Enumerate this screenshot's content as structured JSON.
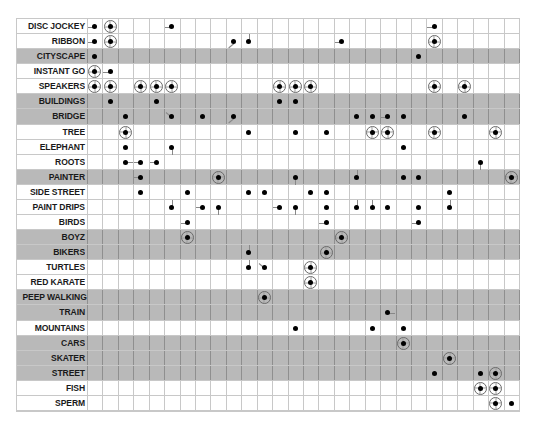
{
  "chart_data": {
    "type": "table",
    "title": "",
    "columns": 28,
    "grid": true,
    "mark_types": {
      "dot": "filled black dot",
      "ring": "filled dot inside circled crosshair",
      "tick_directions": [
        "left",
        "right",
        "up",
        "down",
        "diag-up",
        "diag-down"
      ]
    },
    "rows": [
      {
        "label": "DISC JOCKEY",
        "shaded": false,
        "marks": [
          {
            "col": 0,
            "type": "dot",
            "tick": "left"
          },
          {
            "col": 1,
            "type": "ring"
          },
          {
            "col": 5,
            "type": "dot",
            "tick": "left"
          },
          {
            "col": 22,
            "type": "dot",
            "tick": "left"
          }
        ]
      },
      {
        "label": "RIBBON",
        "shaded": false,
        "marks": [
          {
            "col": 0,
            "type": "dot",
            "tick": "left"
          },
          {
            "col": 1,
            "type": "ring"
          },
          {
            "col": 9,
            "type": "dot",
            "tick": "diag-up"
          },
          {
            "col": 10,
            "type": "dot",
            "tick": "up"
          },
          {
            "col": 16,
            "type": "dot",
            "tick": "left"
          },
          {
            "col": 22,
            "type": "ring"
          }
        ]
      },
      {
        "label": "CITYSCAPE",
        "shaded": true,
        "marks": [
          {
            "col": 0,
            "type": "dot"
          },
          {
            "col": 21,
            "type": "dot"
          }
        ]
      },
      {
        "label": "INSTANT GO",
        "shaded": false,
        "marks": [
          {
            "col": 0,
            "type": "ring"
          },
          {
            "col": 1,
            "type": "dot",
            "tick": "left"
          }
        ]
      },
      {
        "label": "SPEAKERS",
        "shaded": false,
        "marks": [
          {
            "col": 0,
            "type": "ring"
          },
          {
            "col": 1,
            "type": "ring"
          },
          {
            "col": 3,
            "type": "ring"
          },
          {
            "col": 4,
            "type": "ring"
          },
          {
            "col": 5,
            "type": "ring"
          },
          {
            "col": 12,
            "type": "ring"
          },
          {
            "col": 13,
            "type": "ring"
          },
          {
            "col": 14,
            "type": "ring"
          },
          {
            "col": 22,
            "type": "ring"
          },
          {
            "col": 24,
            "type": "ring"
          }
        ]
      },
      {
        "label": "BUILDINGS",
        "shaded": true,
        "marks": [
          {
            "col": 1,
            "type": "dot"
          },
          {
            "col": 4,
            "type": "dot"
          },
          {
            "col": 12,
            "type": "dot"
          },
          {
            "col": 13,
            "type": "dot"
          }
        ]
      },
      {
        "label": "BRIDGE",
        "shaded": true,
        "marks": [
          {
            "col": 2,
            "type": "dot"
          },
          {
            "col": 5,
            "type": "dot",
            "tick": "diag-down"
          },
          {
            "col": 7,
            "type": "dot"
          },
          {
            "col": 9,
            "type": "dot",
            "tick": "diag-up"
          },
          {
            "col": 17,
            "type": "dot"
          },
          {
            "col": 18,
            "type": "dot"
          },
          {
            "col": 19,
            "type": "dot",
            "tick": "left"
          },
          {
            "col": 20,
            "type": "dot"
          },
          {
            "col": 24,
            "type": "dot"
          }
        ]
      },
      {
        "label": "TREE",
        "shaded": false,
        "marks": [
          {
            "col": 2,
            "type": "ring"
          },
          {
            "col": 10,
            "type": "dot"
          },
          {
            "col": 13,
            "type": "dot"
          },
          {
            "col": 15,
            "type": "dot"
          },
          {
            "col": 18,
            "type": "ring"
          },
          {
            "col": 19,
            "type": "ring"
          },
          {
            "col": 22,
            "type": "ring"
          },
          {
            "col": 26,
            "type": "ring"
          }
        ]
      },
      {
        "label": "ELEPHANT",
        "shaded": false,
        "marks": [
          {
            "col": 2,
            "type": "dot"
          },
          {
            "col": 5,
            "type": "dot",
            "tick": "down"
          },
          {
            "col": 20,
            "type": "dot"
          }
        ]
      },
      {
        "label": "ROOTS",
        "shaded": false,
        "marks": [
          {
            "col": 2,
            "type": "dot",
            "tick": "right"
          },
          {
            "col": 3,
            "type": "dot",
            "tick": "left"
          },
          {
            "col": 4,
            "type": "dot",
            "tick": "left"
          },
          {
            "col": 25,
            "type": "dot",
            "tick": "down"
          }
        ]
      },
      {
        "label": "PAINTER",
        "shaded": true,
        "marks": [
          {
            "col": 3,
            "type": "dot",
            "tick": "left"
          },
          {
            "col": 8,
            "type": "ring"
          },
          {
            "col": 13,
            "type": "dot",
            "tick": "down"
          },
          {
            "col": 17,
            "type": "dot",
            "tick": "up"
          },
          {
            "col": 20,
            "type": "dot"
          },
          {
            "col": 21,
            "type": "dot"
          },
          {
            "col": 27,
            "type": "ring"
          }
        ]
      },
      {
        "label": "SIDE STREET",
        "shaded": false,
        "marks": [
          {
            "col": 3,
            "type": "dot"
          },
          {
            "col": 6,
            "type": "dot"
          },
          {
            "col": 10,
            "type": "dot"
          },
          {
            "col": 11,
            "type": "dot"
          },
          {
            "col": 14,
            "type": "dot"
          },
          {
            "col": 15,
            "type": "dot"
          },
          {
            "col": 23,
            "type": "dot"
          }
        ]
      },
      {
        "label": "PAINT DRIPS",
        "shaded": false,
        "marks": [
          {
            "col": 5,
            "type": "dot",
            "tick": "up"
          },
          {
            "col": 7,
            "type": "dot",
            "tick": "left"
          },
          {
            "col": 8,
            "type": "dot",
            "tick": "down"
          },
          {
            "col": 12,
            "type": "dot",
            "tick": "left"
          },
          {
            "col": 13,
            "type": "dot",
            "tick": "down"
          },
          {
            "col": 15,
            "type": "dot"
          },
          {
            "col": 17,
            "type": "dot",
            "tick": "up"
          },
          {
            "col": 18,
            "type": "dot",
            "tick": "up"
          },
          {
            "col": 19,
            "type": "dot"
          },
          {
            "col": 21,
            "type": "dot"
          },
          {
            "col": 23,
            "type": "dot",
            "tick": "up"
          }
        ]
      },
      {
        "label": "BIRDS",
        "shaded": false,
        "marks": [
          {
            "col": 6,
            "type": "dot",
            "tick": "left"
          },
          {
            "col": 15,
            "type": "dot",
            "tick": "left"
          },
          {
            "col": 21,
            "type": "dot",
            "tick": "left"
          }
        ]
      },
      {
        "label": "BOYZ",
        "shaded": true,
        "marks": [
          {
            "col": 6,
            "type": "ring"
          },
          {
            "col": 16,
            "type": "ring"
          }
        ]
      },
      {
        "label": "BIKERS",
        "shaded": true,
        "marks": [
          {
            "col": 10,
            "type": "dot",
            "tick": "up"
          },
          {
            "col": 15,
            "type": "ring"
          }
        ]
      },
      {
        "label": "TURTLES",
        "shaded": false,
        "marks": [
          {
            "col": 10,
            "type": "dot",
            "tick": "up"
          },
          {
            "col": 11,
            "type": "dot",
            "tick": "diag-down"
          },
          {
            "col": 14,
            "type": "ring"
          }
        ]
      },
      {
        "label": "RED KARATE",
        "shaded": false,
        "marks": [
          {
            "col": 14,
            "type": "ring"
          }
        ]
      },
      {
        "label": "PEEP WALKING",
        "shaded": true,
        "marks": [
          {
            "col": 11,
            "type": "ring"
          }
        ]
      },
      {
        "label": "TRAIN",
        "shaded": true,
        "marks": [
          {
            "col": 19,
            "type": "dot",
            "tick": "right"
          }
        ]
      },
      {
        "label": "MOUNTAINS",
        "shaded": false,
        "marks": [
          {
            "col": 13,
            "type": "dot"
          },
          {
            "col": 18,
            "type": "dot"
          },
          {
            "col": 20,
            "type": "dot"
          }
        ]
      },
      {
        "label": "CARS",
        "shaded": true,
        "marks": [
          {
            "col": 20,
            "type": "ring"
          }
        ]
      },
      {
        "label": "SKATER",
        "shaded": true,
        "marks": [
          {
            "col": 23,
            "type": "ring"
          }
        ]
      },
      {
        "label": "STREET",
        "shaded": true,
        "marks": [
          {
            "col": 22,
            "type": "dot"
          },
          {
            "col": 25,
            "type": "dot"
          },
          {
            "col": 26,
            "type": "ring"
          }
        ]
      },
      {
        "label": "FISH",
        "shaded": false,
        "marks": [
          {
            "col": 25,
            "type": "ring"
          },
          {
            "col": 26,
            "type": "ring"
          }
        ]
      },
      {
        "label": "SPERM",
        "shaded": false,
        "marks": [
          {
            "col": 26,
            "type": "ring"
          },
          {
            "col": 27,
            "type": "dot"
          }
        ]
      }
    ],
    "colors": {
      "shaded_row": "#b9b9b9",
      "grid_line": "#c8c8c8",
      "dot": "#000000",
      "label_text": "#1a1a1a"
    }
  }
}
